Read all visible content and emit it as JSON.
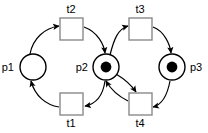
{
  "diagram": {
    "type": "petri-net",
    "width": 208,
    "height": 133,
    "background_color": "#ffffff",
    "stroke_color": "#000000",
    "transition_stroke_color": "#8a8a8a",
    "token_color": "#000000"
  },
  "places": [
    {
      "id": "p1",
      "label": "p1",
      "tokens": 0,
      "cx": 33,
      "cy": 67,
      "r": 13,
      "label_x": 14,
      "label_y": 71,
      "label_anchor": "end"
    },
    {
      "id": "p2",
      "label": "p2",
      "tokens": 1,
      "cx": 106,
      "cy": 67,
      "r": 13,
      "label_x": 88,
      "label_y": 71,
      "label_anchor": "end"
    },
    {
      "id": "p3",
      "label": "p3",
      "tokens": 1,
      "cx": 172,
      "cy": 67,
      "r": 13,
      "label_x": 190,
      "label_y": 71,
      "label_anchor": "start"
    }
  ],
  "transitions": [
    {
      "id": "t2",
      "label": "t2",
      "x": 60,
      "y": 18,
      "w": 23,
      "h": 22,
      "label_x": 71,
      "label_y": 13,
      "label_anchor": "middle"
    },
    {
      "id": "t3",
      "label": "t3",
      "x": 129,
      "y": 18,
      "w": 23,
      "h": 22,
      "label_x": 140,
      "label_y": 13,
      "label_anchor": "middle"
    },
    {
      "id": "t1",
      "label": "t1",
      "x": 60,
      "y": 93,
      "w": 23,
      "h": 22,
      "label_x": 71,
      "label_y": 127,
      "label_anchor": "middle"
    },
    {
      "id": "t4",
      "label": "t4",
      "x": 129,
      "y": 93,
      "w": 23,
      "h": 22,
      "label_x": 140,
      "label_y": 127,
      "label_anchor": "middle"
    }
  ],
  "arcs": [
    {
      "id": "p1-t2",
      "from": "p1",
      "to": "t2",
      "path": "M 30,54 C 33,38 45,28 59,26"
    },
    {
      "id": "t2-p2",
      "from": "t2",
      "to": "p2",
      "path": "M 84,27 C 98,32 104,45 105,53"
    },
    {
      "id": "p2-t1",
      "from": "p2",
      "to": "t1",
      "path": "M 105,81 C 103,95 96,104 85,106"
    },
    {
      "id": "t1-p1",
      "from": "t1",
      "to": "p1",
      "path": "M 59,107 C 46,105 35,96 31,81"
    },
    {
      "id": "p2-t3",
      "from": "p2",
      "to": "t3",
      "path": "M 110,55 C 114,39 118,29 128,26"
    },
    {
      "id": "t3-p3",
      "from": "t3",
      "to": "p3",
      "path": "M 153,27 C 164,31 170,44 171,53"
    },
    {
      "id": "p3-t4",
      "from": "p3",
      "to": "t4",
      "path": "M 170,81 C 167,97 161,105 153,107"
    },
    {
      "id": "t4-p2",
      "from": "t4",
      "to": "p2",
      "path": "M 128,101 C 118,96 110,88 106,81"
    },
    {
      "id": "p2-t4",
      "from": "p2",
      "to": "t4",
      "path": "M 116,74 C 126,80 132,86 136,92"
    }
  ],
  "legend": {
    "place_description": "circle",
    "transition_description": "square",
    "token_description": "filled dot"
  }
}
